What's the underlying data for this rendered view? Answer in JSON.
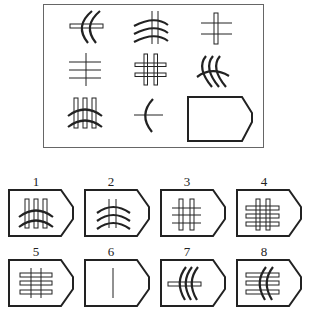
{
  "puzzle": {
    "grid": {
      "rows": 3,
      "cols": 3,
      "cells": [
        {
          "row": 1,
          "col": 1,
          "description": "two vertical arcs crossing a horizontal bar"
        },
        {
          "row": 1,
          "col": 2,
          "description": "three horizontal arcs crossing two vertical lines"
        },
        {
          "row": 1,
          "col": 3,
          "description": "one vertical bar crossing two horizontal lines"
        },
        {
          "row": 2,
          "col": 1,
          "description": "one vertical line crossing three horizontal lines"
        },
        {
          "row": 2,
          "col": 2,
          "description": "two vertical bars crossing two horizontal bars"
        },
        {
          "row": 2,
          "col": 3,
          "description": "three vertical arcs crossing one horizontal arc"
        },
        {
          "row": 3,
          "col": 1,
          "description": "three vertical bars crossing two horizontal arcs"
        },
        {
          "row": 3,
          "col": 2,
          "description": "one vertical arc crossing a horizontal line"
        },
        {
          "row": 3,
          "col": 3,
          "description": "missing cell (pentagon placeholder)"
        }
      ]
    },
    "options": [
      {
        "label": "1",
        "description": "three vertical bars crossing two horizontal arcs"
      },
      {
        "label": "2",
        "description": "three horizontal arcs crossing two vertical lines"
      },
      {
        "label": "3",
        "description": "two vertical bars crossing three horizontal lines"
      },
      {
        "label": "4",
        "description": "two vertical bars crossing three horizontal bars"
      },
      {
        "label": "5",
        "description": "two vertical lines crossing three horizontal bars"
      },
      {
        "label": "6",
        "description": "single vertical line"
      },
      {
        "label": "7",
        "description": "three vertical arcs crossing a horizontal bar"
      },
      {
        "label": "8",
        "description": "two vertical arcs crossing three horizontal bars"
      }
    ]
  }
}
